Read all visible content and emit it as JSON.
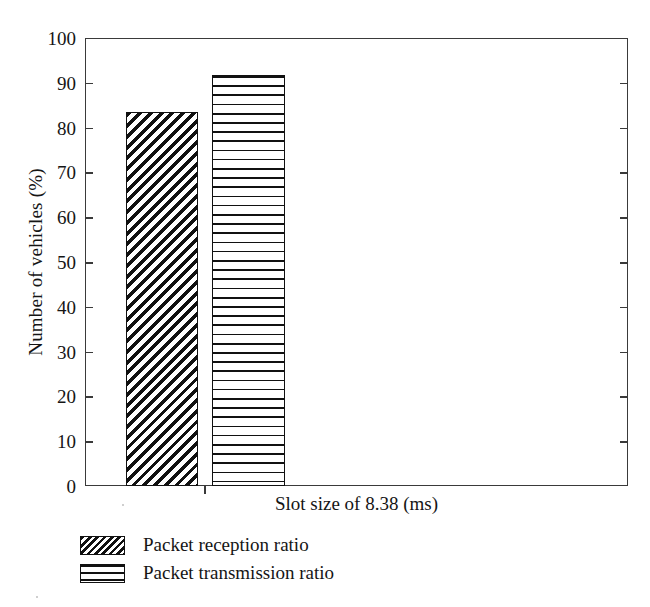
{
  "chart_data": {
    "type": "bar",
    "title": "",
    "xlabel": "Slot size of 8.38 (ms)",
    "ylabel": "Number of vehicles (%)",
    "categories": [
      "Slot size of 8.38 (ms)"
    ],
    "series": [
      {
        "name": "Packet reception ratio",
        "values": [
          83.5
        ],
        "pattern": "diagonal-hatch"
      },
      {
        "name": "Packet transmission ratio",
        "values": [
          91.8
        ],
        "pattern": "horizontal-lines"
      }
    ],
    "ylim": [
      0,
      100
    ],
    "ytick_labels": [
      "0",
      "10",
      "20",
      "30",
      "40",
      "50",
      "60",
      "70",
      "80",
      "90",
      "100"
    ],
    "ytick_values": [
      0,
      10,
      20,
      30,
      40,
      50,
      60,
      70,
      80,
      90,
      100
    ],
    "grid": false,
    "legend_position": "below-axes-left",
    "frame": "box",
    "colors": {
      "ink": "#111111",
      "axis": "#3a3a3a",
      "background": "#ffffff"
    }
  },
  "legend": {
    "items": [
      {
        "label": "Packet reception ratio"
      },
      {
        "label": "Packet transmission ratio"
      }
    ]
  }
}
